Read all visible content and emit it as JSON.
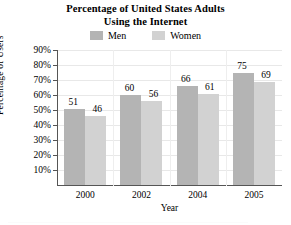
{
  "chart_data": {
    "type": "bar",
    "title": "Percentage of United States Adults Using the Internet",
    "title_lines": [
      "Percentage of United States Adults",
      "Using the Internet"
    ],
    "xlabel": "Year",
    "ylabel": "Percentage of Users",
    "categories": [
      "2000",
      "2002",
      "2004",
      "2005"
    ],
    "series": [
      {
        "name": "Men",
        "values": [
          51,
          60,
          66,
          75
        ],
        "color": "#b4b4b4"
      },
      {
        "name": "Women",
        "values": [
          46,
          56,
          61,
          69
        ],
        "color": "#d2d2d2"
      }
    ],
    "ylim": [
      0,
      90
    ],
    "ytick_labels": [
      "90%",
      "80%",
      "70%",
      "60%",
      "50%",
      "40%",
      "30%",
      "20%",
      "10%"
    ],
    "ytick_values": [
      90,
      80,
      70,
      60,
      50,
      40,
      30,
      20,
      10
    ],
    "grid": true,
    "legend_position": "top-center",
    "value_labels": true
  },
  "legend": {
    "entries": [
      {
        "label": "Men",
        "swatch": "men-swatch"
      },
      {
        "label": "Women",
        "swatch": "women-swatch"
      }
    ]
  },
  "colors": {
    "men": "#b4b4b4",
    "women": "#d2d2d2",
    "axis": "#555555",
    "grid": "#e8e8e8",
    "text": "#000000"
  }
}
